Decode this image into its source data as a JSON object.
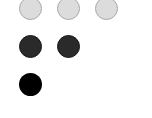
{
  "dots": {
    "row1": [
      {
        "state": "light",
        "color": "#dcdcdc"
      },
      {
        "state": "light",
        "color": "#dcdcdc"
      },
      {
        "state": "light",
        "color": "#dcdcdc"
      }
    ],
    "row2": [
      {
        "state": "dark",
        "color": "#2a2a2a"
      },
      {
        "state": "dark",
        "color": "#2a2a2a"
      }
    ],
    "row3": [
      {
        "state": "black",
        "color": "#000000"
      }
    ]
  }
}
